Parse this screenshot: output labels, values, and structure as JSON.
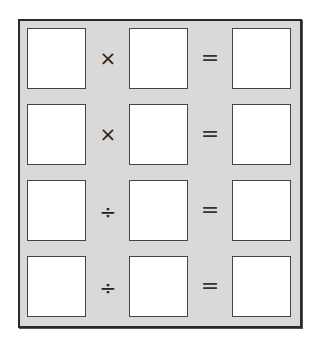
{
  "worksheet": {
    "rows": [
      {
        "operator": "×",
        "operator_name": "multiply",
        "equals": "="
      },
      {
        "operator": "×",
        "operator_name": "multiply",
        "equals": "="
      },
      {
        "operator": "÷",
        "operator_name": "divide",
        "equals": "="
      },
      {
        "operator": "÷",
        "operator_name": "divide",
        "equals": "="
      }
    ],
    "colors": {
      "background": "#d9d9d9",
      "box_fill": "#ffffff",
      "border": "#2a2a2a"
    }
  }
}
